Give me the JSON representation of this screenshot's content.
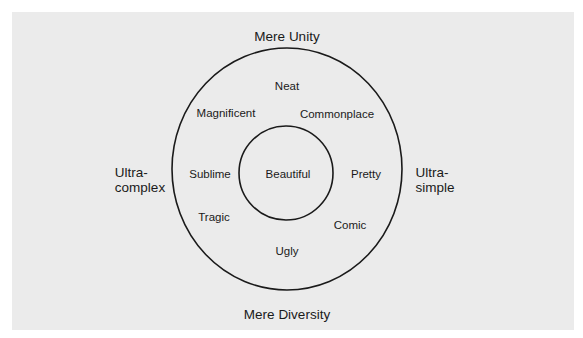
{
  "diagram": {
    "title": "",
    "axes": {
      "top": "Mere Unity",
      "bottom": "Mere Diversity",
      "left": {
        "line1": "Ultra-",
        "line2": "complex"
      },
      "right": {
        "line1": "Ultra-",
        "line2": "simple"
      }
    },
    "center": "Beautiful",
    "ring_labels": {
      "neat": "Neat",
      "magnificent": "Magnificent",
      "commonplace": "Commonplace",
      "sublime": "Sublime",
      "pretty": "Pretty",
      "tragic": "Tragic",
      "comic": "Comic",
      "ugly": "Ugly"
    },
    "colors": {
      "background": "#ebebeb",
      "stroke": "#1a1a1a",
      "text": "#1a1a1a"
    }
  }
}
